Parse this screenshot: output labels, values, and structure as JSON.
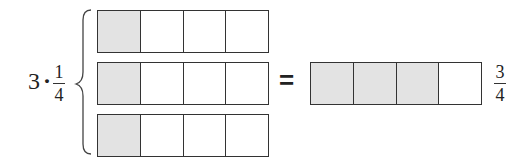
{
  "expression": {
    "multiplier": "3",
    "operator": "·",
    "fraction": {
      "numerator": "1",
      "denominator": "4"
    }
  },
  "left_bars": [
    {
      "cells": 4,
      "shaded": 1
    },
    {
      "cells": 4,
      "shaded": 1
    },
    {
      "cells": 4,
      "shaded": 1
    }
  ],
  "equals_sign": "=",
  "result_bar": {
    "cells": 4,
    "shaded": 3
  },
  "result_fraction": {
    "numerator": "3",
    "denominator": "4"
  },
  "colors": {
    "shaded": "#e3e3e3",
    "outline": "#333333"
  }
}
